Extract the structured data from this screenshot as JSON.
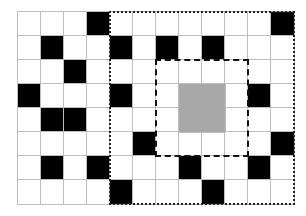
{
  "grid": {
    "cols": 12,
    "rows": 8,
    "cell_width": 23,
    "cell_height": 24,
    "colors": {
      "empty": "#ffffff",
      "filled": "#000000",
      "highlight": "#a9a9a9",
      "gridline": "#bdbdbd"
    },
    "black_cells": [
      [
        0,
        3
      ],
      [
        0,
        11
      ],
      [
        1,
        1
      ],
      [
        1,
        4
      ],
      [
        1,
        6
      ],
      [
        1,
        8
      ],
      [
        2,
        2
      ],
      [
        3,
        0
      ],
      [
        3,
        4
      ],
      [
        3,
        10
      ],
      [
        4,
        1
      ],
      [
        4,
        2
      ],
      [
        5,
        5
      ],
      [
        5,
        11
      ],
      [
        6,
        1
      ],
      [
        6,
        3
      ],
      [
        6,
        7
      ],
      [
        6,
        10
      ],
      [
        7,
        4
      ],
      [
        7,
        8
      ]
    ],
    "grey_region": {
      "row": 3,
      "col": 7,
      "rows": 2,
      "cols": 2
    }
  },
  "outer_dotted_box": {
    "col": 4,
    "row": 0,
    "cols": 8,
    "rows": 8
  },
  "inner_dashed_box": {
    "col": 6,
    "row": 2,
    "cols": 4,
    "rows": 4
  }
}
